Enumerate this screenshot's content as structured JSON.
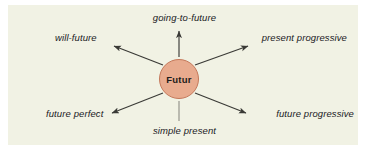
{
  "panel": {
    "background_color": "#f1f2e4",
    "outer_background_color": "#ffffff"
  },
  "center": {
    "label": "Futur",
    "fill_color": "#e8ab8e",
    "stroke_color": "#c4785a"
  },
  "stroke_color": "#3a3a36",
  "diagram_data": {
    "type": "radial-spoke",
    "center_node": "Futur",
    "spokes": [
      {
        "label": "going-to-future",
        "direction": "up",
        "arrowhead": true
      },
      {
        "label": "will-future",
        "direction": "up-left",
        "arrowhead": true
      },
      {
        "label": "present progressive",
        "direction": "up-right",
        "arrowhead": true
      },
      {
        "label": "future perfect",
        "direction": "down-left",
        "arrowhead": true
      },
      {
        "label": "future progressive",
        "direction": "down-right",
        "arrowhead": true
      },
      {
        "label": "simple present",
        "direction": "down",
        "arrowhead": false
      }
    ]
  },
  "labels": {
    "going_to_future": "going-to-future",
    "will_future": "will-future",
    "present_progressive": "present progressive",
    "future_perfect": "future perfect",
    "future_progressive": "future progressive",
    "simple_present": "simple present"
  }
}
